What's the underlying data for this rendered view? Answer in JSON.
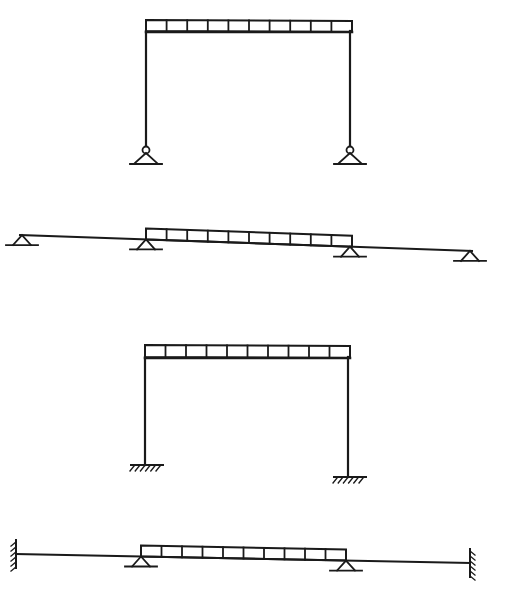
{
  "diagram": {
    "stroke_color": "#1a1a1a",
    "background": "#ffffff",
    "figures": [
      {
        "id": "pinned-portal-frame",
        "type": "portal-frame",
        "support_type": "pin",
        "load": {
          "type": "distributed",
          "segments": 10,
          "x1": 146,
          "x2": 352,
          "y_top": 20,
          "y_bottom": 31
        },
        "beam": {
          "y": 31,
          "x1": 146,
          "x2": 352
        },
        "columns": [
          {
            "x": 146,
            "y_top": 31,
            "y_bottom": 147
          },
          {
            "x": 350,
            "y_top": 31,
            "y_bottom": 147
          }
        ],
        "supports": [
          {
            "x": 146,
            "y": 147
          },
          {
            "x": 350,
            "y": 147
          }
        ]
      },
      {
        "id": "pinned-continuous-beam",
        "type": "continuous-beam",
        "support_type": "pin",
        "beam": {
          "x1": 20,
          "y1": 235,
          "x2": 472,
          "y2": 251
        },
        "load": {
          "type": "distributed",
          "segments": 10,
          "x1": 146,
          "x2": 352
        },
        "supports": [
          {
            "x": 22
          },
          {
            "x": 146
          },
          {
            "x": 350
          },
          {
            "x": 470
          }
        ]
      },
      {
        "id": "fixed-portal-frame",
        "type": "portal-frame",
        "support_type": "fixed",
        "load": {
          "type": "distributed",
          "segments": 10,
          "x1": 145,
          "x2": 350,
          "y_top": 345,
          "y_bottom": 357
        },
        "beam": {
          "y": 357,
          "x1": 145,
          "x2": 350
        },
        "columns": [
          {
            "x": 145,
            "y_top": 357,
            "y_bottom": 465
          },
          {
            "x": 348,
            "y_top": 357,
            "y_bottom": 477
          }
        ],
        "supports": [
          {
            "x": 145,
            "y": 465
          },
          {
            "x": 348,
            "y": 477
          }
        ]
      },
      {
        "id": "fixed-end-continuous-beam",
        "type": "continuous-beam",
        "support_type": "fixed-ends-with-intermediate-pins",
        "beam": {
          "x1": 16,
          "y1": 554,
          "x2": 470,
          "y2": 563
        },
        "load": {
          "type": "distributed",
          "segments": 10,
          "x1": 141,
          "x2": 346
        },
        "supports": [
          {
            "type": "fixed-wall",
            "x": 16
          },
          {
            "type": "pin",
            "x": 141
          },
          {
            "type": "pin",
            "x": 346
          },
          {
            "type": "fixed-wall",
            "x": 470
          }
        ]
      }
    ]
  }
}
